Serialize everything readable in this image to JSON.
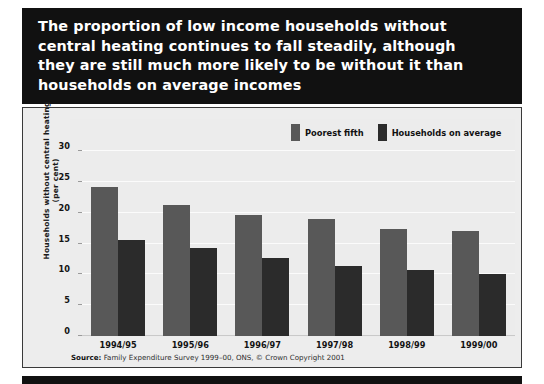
{
  "headline": {
    "text": "The proportion of low income households without\ncentral heating continues to fall steadily, although\nthey are still much more likely to be without it than\nhouseholds on average incomes"
  },
  "source": {
    "label": "Source:",
    "text": " Family Expenditure Survey 1999–00, ONS, © Crown Copyright 2001"
  },
  "colors": {
    "headline_background": "#111111",
    "panel_background": "#ededed",
    "poorest_fifth": "#585858",
    "households_on_average": "#2b2b2b",
    "gridline": "#fbfbfb"
  },
  "chart_data": {
    "type": "bar",
    "title": "The proportion of low income households without central heating continues to fall steadily, although they are still much more likely to be without it than households on average incomes",
    "xlabel": "",
    "ylabel": "Households without central heating (per cent)",
    "ylim": [
      0,
      30
    ],
    "yticks": [
      0,
      5,
      10,
      15,
      20,
      25,
      30
    ],
    "ytick_labels": [
      "0",
      "5",
      "10",
      "15",
      "20",
      "25",
      "30"
    ],
    "grid": true,
    "legend_position": "top-right",
    "categories": [
      "1994/95",
      "1995/96",
      "1996/97",
      "1997/98",
      "1998/99",
      "1999/00"
    ],
    "series": [
      {
        "name": "Poorest fifth",
        "color": "#585858",
        "values": [
          24.2,
          21.3,
          19.7,
          18.9,
          17.3,
          17.1
        ]
      },
      {
        "name": "Households on average",
        "color": "#2b2b2b",
        "values": [
          15.5,
          14.3,
          12.7,
          11.3,
          10.7,
          10.0
        ]
      }
    ]
  }
}
